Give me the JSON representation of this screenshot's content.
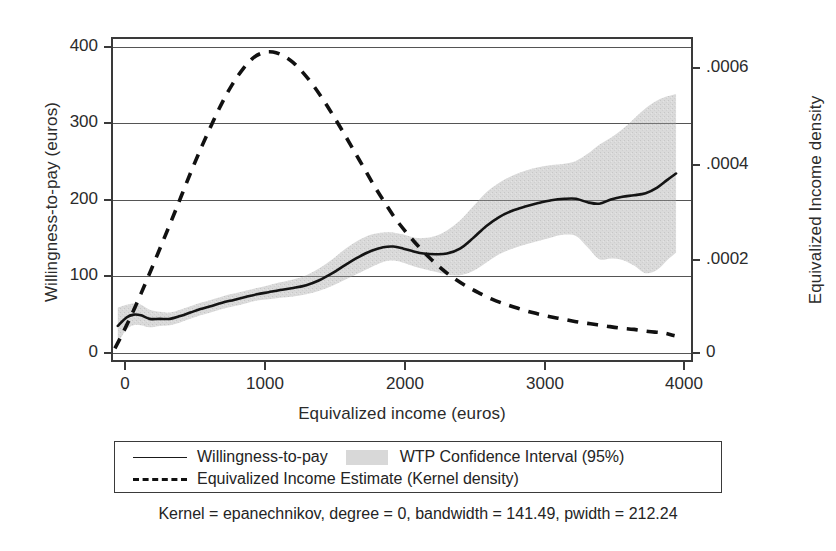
{
  "chart_data": {
    "type": "line",
    "title": "",
    "subtitle": "",
    "xlabel": "Equivalized income (euros)",
    "ylabel": "Willingness-to-pay (euros)",
    "ylabel_right": "Equivalized Income density",
    "xlim": [
      0,
      4000
    ],
    "ylim": [
      -40,
      420
    ],
    "ylim_right": [
      -5.83e-05,
      0.000612
    ],
    "grid": "horizontal",
    "legend_position": "below-plot",
    "xticks": [
      0,
      1000,
      2000,
      3000,
      4000
    ],
    "xticklabels": [
      "0",
      "1000",
      "2000",
      "3000",
      "4000"
    ],
    "yticks_left": [
      0,
      100,
      200,
      300,
      400
    ],
    "yticklabels_left": [
      "0",
      "100",
      "200",
      "300",
      "400"
    ],
    "yticks_right": [
      0,
      0.0002,
      0.0004,
      0.0006
    ],
    "yticklabels_right": [
      "0",
      ".0002",
      ".0004",
      ".0006"
    ],
    "note": "Kernel = epanechnikov, degree = 0, bandwidth = 141.49, pwidth = 212.24",
    "series": [
      {
        "name": "Willingness-to-pay",
        "axis": "left",
        "style": "solid",
        "color": "#1a1a1a",
        "x": [
          40,
          100,
          150,
          200,
          260,
          330,
          400,
          470,
          540,
          610,
          680,
          760,
          840,
          920,
          1000,
          1080,
          1160,
          1250,
          1340,
          1430,
          1520,
          1610,
          1700,
          1790,
          1870,
          1940,
          2010,
          2080,
          2150,
          2230,
          2310,
          2400,
          2490,
          2580,
          2670,
          2760,
          2850,
          2940,
          3030,
          3120,
          3200,
          3280,
          3360,
          3440,
          3520,
          3600,
          3680,
          3760,
          3830,
          3890
        ],
        "y": [
          10,
          22,
          26,
          25,
          20,
          20,
          20,
          24,
          29,
          34,
          38,
          43,
          47,
          51,
          55,
          58,
          61,
          64,
          68,
          75,
          85,
          97,
          108,
          117,
          122,
          123,
          120,
          116,
          113,
          112,
          113,
          120,
          135,
          152,
          165,
          174,
          180,
          185,
          189,
          191,
          191,
          186,
          184,
          190,
          194,
          196,
          199,
          207,
          218,
          227
        ]
      },
      {
        "name": "WTP Confidence Interval (95%) upper",
        "axis": "left",
        "style": "band-upper",
        "color": "#d8d8d8",
        "x": [
          40,
          100,
          150,
          200,
          260,
          330,
          400,
          470,
          540,
          610,
          680,
          760,
          840,
          920,
          1000,
          1080,
          1160,
          1250,
          1340,
          1430,
          1520,
          1610,
          1700,
          1790,
          1870,
          1940,
          2010,
          2080,
          2150,
          2230,
          2310,
          2400,
          2490,
          2580,
          2670,
          2760,
          2850,
          2940,
          3030,
          3120,
          3200,
          3280,
          3360,
          3440,
          3520,
          3600,
          3680,
          3760,
          3830,
          3890
        ],
        "y": [
          36,
          40,
          42,
          40,
          33,
          30,
          29,
          33,
          38,
          43,
          47,
          52,
          56,
          60,
          64,
          68,
          72,
          76,
          82,
          92,
          105,
          120,
          132,
          140,
          143,
          143,
          140,
          136,
          135,
          138,
          146,
          160,
          180,
          200,
          214,
          224,
          231,
          236,
          239,
          241,
          245,
          255,
          268,
          278,
          290,
          305,
          320,
          331,
          337,
          340
        ]
      },
      {
        "name": "WTP Confidence Interval (95%) lower",
        "axis": "left",
        "style": "band-lower",
        "color": "#d8d8d8",
        "x": [
          40,
          100,
          150,
          200,
          260,
          330,
          400,
          470,
          540,
          610,
          680,
          760,
          840,
          920,
          1000,
          1080,
          1160,
          1250,
          1340,
          1430,
          1520,
          1610,
          1700,
          1790,
          1870,
          1940,
          2010,
          2080,
          2150,
          2230,
          2310,
          2400,
          2490,
          2580,
          2670,
          2760,
          2850,
          2940,
          3030,
          3120,
          3200,
          3280,
          3360,
          3440,
          3520,
          3600,
          3680,
          3760,
          3830,
          3890
        ],
        "y": [
          -14,
          5,
          11,
          11,
          8,
          10,
          11,
          15,
          20,
          25,
          29,
          34,
          38,
          42,
          46,
          48,
          50,
          52,
          55,
          60,
          67,
          76,
          85,
          94,
          101,
          103,
          100,
          95,
          91,
          87,
          83,
          82,
          88,
          100,
          112,
          120,
          126,
          131,
          136,
          140,
          138,
          122,
          105,
          106,
          104,
          96,
          85,
          90,
          104,
          114
        ]
      },
      {
        "name": "Equivalized Income Estimate (Kernel density)",
        "axis": "right",
        "style": "dashed",
        "color": "#111111",
        "x": [
          20,
          80,
          140,
          200,
          270,
          340,
          410,
          480,
          550,
          620,
          690,
          760,
          830,
          900,
          970,
          1040,
          1110,
          1180,
          1250,
          1320,
          1390,
          1460,
          1530,
          1600,
          1670,
          1740,
          1810,
          1880,
          1950,
          2030,
          2110,
          2190,
          2270,
          2350,
          2440,
          2530,
          2620,
          2710,
          2800,
          2900,
          3000,
          3100,
          3200,
          3300,
          3400,
          3500,
          3600,
          3700,
          3800,
          3880
        ],
        "y_left_scale": [
          -22,
          2,
          28,
          56,
          90,
          125,
          160,
          196,
          232,
          266,
          298,
          328,
          354,
          375,
          391,
          399,
          400,
          395,
          385,
          370,
          352,
          331,
          308,
          284,
          259,
          234,
          209,
          186,
          164,
          143,
          124,
          107,
          92,
          79,
          67,
          57,
          48,
          41,
          35,
          29,
          24,
          20,
          16,
          13,
          10,
          7,
          5,
          2,
          0,
          -4
        ],
        "y": [
          -3.2e-05,
          3e-06,
          4.1e-05,
          8.2e-05,
          0.000131,
          0.000182,
          0.000233,
          0.000285,
          0.000338,
          0.000387,
          0.000434,
          0.000478,
          0.000515,
          0.000546,
          0.000569,
          0.000581,
          0.000583,
          0.000575,
          0.000561,
          0.000539,
          0.000513,
          0.000482,
          0.000448,
          0.000414,
          0.000377,
          0.000341,
          0.000304,
          0.000271,
          0.000239,
          0.000208,
          0.000181,
          0.000156,
          0.000134,
          0.000115,
          9.8e-05,
          8.3e-05,
          7e-05,
          6e-05,
          5.1e-05,
          4.2e-05,
          3.5e-05,
          2.9e-05,
          2.3e-05,
          1.9e-05,
          1.5e-05,
          1e-05,
          7e-06,
          3e-06,
          0.0,
          -6e-06
        ]
      }
    ]
  },
  "legend": {
    "items": [
      {
        "label": "Willingness-to-pay",
        "marker": "solid-line"
      },
      {
        "label": "WTP Confidence Interval (95%)",
        "marker": "gray-swatch"
      },
      {
        "label": "Equivalized Income Estimate (Kernel density)",
        "marker": "dashed-line"
      }
    ]
  },
  "caption": "Kernel = epanechnikov, degree = 0, bandwidth = 141.49, pwidth = 212.24"
}
